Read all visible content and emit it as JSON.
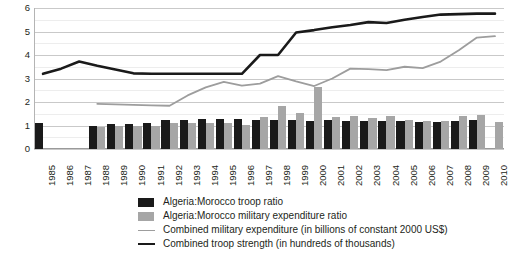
{
  "chart_data": {
    "type": "bar",
    "title": "",
    "subtitle": "",
    "xlabel": "",
    "ylabel": "",
    "ylim": [
      0,
      6
    ],
    "yticks": [
      0,
      1,
      2,
      3,
      4,
      5,
      6
    ],
    "ytick_labels": [
      "0",
      "1",
      "2",
      "3",
      "4",
      "5",
      "6"
    ],
    "minor_tick_step": 0.5,
    "grid": true,
    "grid_axis": "y",
    "legend_position": "bottom",
    "categories": [
      "1985",
      "1986",
      "1987",
      "1988",
      "1989",
      "1990",
      "1991",
      "1992",
      "1993",
      "1994",
      "1995",
      "1996",
      "1997",
      "1998",
      "1999",
      "2000",
      "2001",
      "2002",
      "2003",
      "2004",
      "2005",
      "2006",
      "2007",
      "2008",
      "2009",
      "2010"
    ],
    "series": [
      {
        "name": "Algeria:Morocco troop ratio",
        "render": "bar",
        "color": "#1a1a1a",
        "values": [
          1.1,
          null,
          null,
          0.98,
          1.06,
          1.08,
          1.1,
          1.22,
          1.24,
          1.26,
          1.28,
          1.26,
          1.24,
          1.22,
          1.22,
          1.2,
          1.22,
          1.18,
          1.2,
          1.2,
          1.18,
          1.16,
          1.16,
          1.18,
          1.22,
          null
        ]
      },
      {
        "name": "Algeria:Morocco military expenditure ratio",
        "render": "bar",
        "color": "#a6a6a6",
        "values": [
          null,
          null,
          null,
          0.92,
          0.96,
          0.98,
          1.0,
          1.1,
          1.12,
          1.12,
          1.1,
          1.04,
          1.38,
          1.82,
          1.54,
          2.62,
          1.36,
          1.4,
          1.34,
          1.4,
          1.22,
          1.2,
          1.18,
          1.4,
          1.46,
          1.16
        ]
      },
      {
        "name": "Combined military expenditure (in billions of constant 2000 US$)",
        "render": "line",
        "color": "#9d9d9d",
        "values": [
          null,
          null,
          null,
          1.92,
          1.9,
          1.88,
          1.86,
          1.84,
          2.28,
          2.62,
          2.86,
          2.7,
          2.78,
          3.1,
          2.88,
          2.68,
          3.0,
          3.42,
          3.4,
          3.36,
          3.5,
          3.44,
          3.72,
          4.2,
          4.74,
          4.8
        ]
      },
      {
        "name": "Combined troop strength (in hundreds of thousands)",
        "render": "line",
        "color": "#1a1a1a",
        "values": [
          3.2,
          3.42,
          3.72,
          3.54,
          3.38,
          3.22,
          3.2,
          3.2,
          3.2,
          3.2,
          3.2,
          3.2,
          4.0,
          4.0,
          4.96,
          5.06,
          5.18,
          5.28,
          5.4,
          5.36,
          5.5,
          5.62,
          5.72,
          5.74,
          5.76,
          5.76
        ]
      }
    ]
  }
}
